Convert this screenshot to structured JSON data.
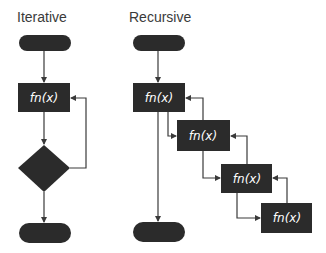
{
  "iterative": {
    "title": "Iterative",
    "process_label": "fn(x)"
  },
  "recursive": {
    "title": "Recursive",
    "calls": [
      {
        "label": "fn(x)"
      },
      {
        "label": "fn(x)"
      },
      {
        "label": "fn(x)"
      },
      {
        "label": "fn(x)"
      }
    ]
  },
  "colors": {
    "shape_fill": "#2b2b2b",
    "line": "#3a3a3a",
    "text_on_shape": "#ffffff",
    "title_text": "#3a3a3a"
  }
}
